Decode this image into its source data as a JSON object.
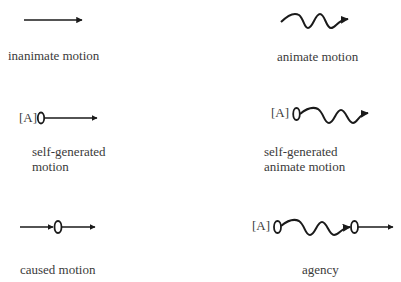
{
  "panels": [
    {
      "id": "inanimate",
      "label_lines": [
        "inanimate motion"
      ],
      "agent": ""
    },
    {
      "id": "animate",
      "label_lines": [
        "animate motion"
      ],
      "agent": ""
    },
    {
      "id": "self-generated",
      "label_lines": [
        "self-generated",
        "motion"
      ],
      "agent": "[A]"
    },
    {
      "id": "self-generated-animate",
      "label_lines": [
        "self-generated",
        "animate motion"
      ],
      "agent": "[A]"
    },
    {
      "id": "caused",
      "label_lines": [
        "caused motion"
      ],
      "agent": ""
    },
    {
      "id": "agency",
      "label_lines": [
        "agency"
      ],
      "agent": "[A]"
    }
  ],
  "colors": {
    "stroke": "#1a1a1a",
    "text": "#3a3a3a",
    "background": "#ffffff"
  }
}
